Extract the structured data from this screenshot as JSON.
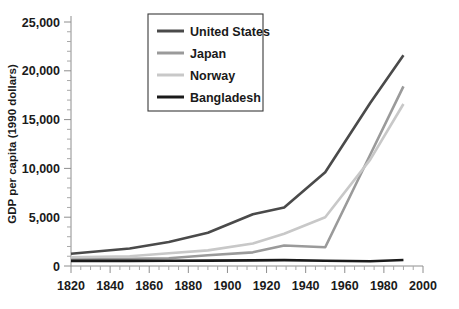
{
  "chart_data": {
    "type": "line",
    "title": "",
    "xlabel": "",
    "ylabel": "GDP per capita (1990 dollars)",
    "xlim": [
      1820,
      2000
    ],
    "ylim": [
      0,
      25000
    ],
    "grid": false,
    "legend_position": "top-center",
    "x_ticks": [
      1820,
      1840,
      1860,
      1880,
      1900,
      1920,
      1940,
      1960,
      1980,
      2000
    ],
    "x_tick_labels": [
      "1820",
      "1840",
      "1860",
      "1880",
      "1900",
      "1920",
      "1940",
      "1960",
      "1980",
      "2000"
    ],
    "x_minor_step": 5,
    "y_ticks": [
      0,
      5000,
      10000,
      15000,
      20000,
      25000
    ],
    "y_tick_labels": [
      "0",
      "5,000",
      "10,000",
      "15,000",
      "20,000",
      "25,000"
    ],
    "y_minor_step": 1000,
    "series": [
      {
        "name": "United States",
        "color": "#4a4a4a",
        "x": [
          1820,
          1850,
          1870,
          1890,
          1913,
          1929,
          1950,
          1973,
          1990
        ],
        "values": [
          1250,
          1800,
          2450,
          3400,
          5300,
          6000,
          9600,
          16700,
          21600
        ]
      },
      {
        "name": "Japan",
        "color": "#9a9a9a",
        "x": [
          1820,
          1850,
          1870,
          1890,
          1913,
          1929,
          1950,
          1973,
          1990
        ],
        "values": [
          700,
          750,
          800,
          1100,
          1400,
          2100,
          1920,
          11400,
          18400
        ]
      },
      {
        "name": "Norway",
        "color": "#c8c8c8",
        "x": [
          1820,
          1850,
          1870,
          1890,
          1913,
          1929,
          1950,
          1973,
          1990
        ],
        "values": [
          900,
          1000,
          1300,
          1600,
          2300,
          3300,
          5000,
          10900,
          16600
        ]
      },
      {
        "name": "Bangladesh",
        "color": "#1a1a1a",
        "x": [
          1820,
          1850,
          1870,
          1890,
          1913,
          1929,
          1950,
          1973,
          1990
        ],
        "values": [
          530,
          530,
          540,
          550,
          580,
          600,
          540,
          480,
          620
        ]
      }
    ]
  },
  "legend": {
    "items": [
      {
        "label": "United States"
      },
      {
        "label": "Japan"
      },
      {
        "label": "Norway"
      },
      {
        "label": "Bangladesh"
      }
    ]
  }
}
